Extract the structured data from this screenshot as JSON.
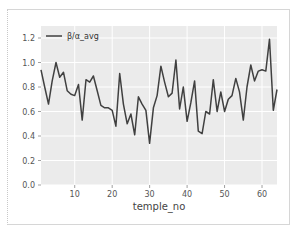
{
  "chart_data": {
    "type": "line",
    "title": "",
    "xlabel": "temple_no",
    "ylabel": "",
    "xlim": [
      1,
      64
    ],
    "ylim": [
      0.0,
      1.3
    ],
    "grid": true,
    "legend_position": "upper left",
    "x_ticks": [
      10,
      20,
      30,
      40,
      50,
      60
    ],
    "y_ticks": [
      0.0,
      0.2,
      0.4,
      0.6,
      0.8,
      1.0,
      1.2
    ],
    "x_tick_labels": [
      "10",
      "20",
      "30",
      "40",
      "50",
      "60"
    ],
    "y_tick_labels": [
      "0.0",
      "0.2",
      "0.4",
      "0.6",
      "0.8",
      "1.0",
      "1.2"
    ],
    "series": [
      {
        "name": "β/α_avg",
        "color": "#404040",
        "x": [
          1,
          2,
          3,
          4,
          5,
          6,
          7,
          8,
          9,
          10,
          11,
          12,
          13,
          14,
          15,
          16,
          17,
          18,
          19,
          20,
          21,
          22,
          23,
          24,
          25,
          26,
          27,
          28,
          29,
          30,
          31,
          32,
          33,
          34,
          35,
          36,
          37,
          38,
          39,
          40,
          41,
          42,
          43,
          44,
          45,
          46,
          47,
          48,
          49,
          50,
          51,
          52,
          53,
          54,
          55,
          56,
          57,
          58,
          59,
          60,
          61,
          62,
          63,
          64
        ],
        "values": [
          0.94,
          0.8,
          0.66,
          0.85,
          1.0,
          0.88,
          0.92,
          0.77,
          0.74,
          0.73,
          0.82,
          0.53,
          0.86,
          0.84,
          0.89,
          0.77,
          0.65,
          0.63,
          0.63,
          0.61,
          0.48,
          0.91,
          0.66,
          0.5,
          0.58,
          0.41,
          0.72,
          0.66,
          0.61,
          0.34,
          0.63,
          0.73,
          0.97,
          0.84,
          0.72,
          0.75,
          1.02,
          0.62,
          0.8,
          0.52,
          0.67,
          0.85,
          0.44,
          0.42,
          0.6,
          0.58,
          0.86,
          0.6,
          0.76,
          0.6,
          0.7,
          0.73,
          0.87,
          0.76,
          0.53,
          0.8,
          0.98,
          0.85,
          0.93,
          0.94,
          0.93,
          1.19,
          0.61,
          0.78
        ]
      }
    ]
  },
  "colors": {
    "plot_background": "#ebebeb",
    "grid": "#ffffff",
    "line": "#404040"
  }
}
